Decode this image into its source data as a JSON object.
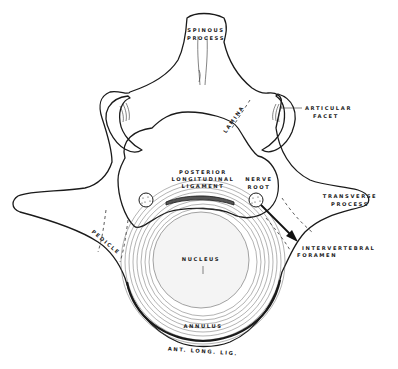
{
  "diagram": {
    "colors": {
      "line": "#1a1a1a",
      "background": "#ffffff",
      "ligament": "#333333"
    },
    "labels": {
      "spinous_1": "SPINOUS",
      "spinous_2": "PROCESS",
      "lamina": "LAMINA",
      "facet_1": "ARTICULAR",
      "facet_2": "FACET",
      "pll_1": "POSTERIOR",
      "pll_2": "LONGITUDINAL",
      "pll_3": "LIGAMENT",
      "nerve_1": "NERVE",
      "nerve_2": "ROOT",
      "transverse_1": "TRANSVERSE",
      "transverse_2": "PROCESS",
      "foramen_1": "INTERVERTEBRAL",
      "foramen_2": "FORAMEN",
      "pedicle": "PEDICLE",
      "nucleus": "NUCLEUS",
      "annulus": "ANNULUS",
      "all": "ANT. LONG. LIG."
    }
  }
}
